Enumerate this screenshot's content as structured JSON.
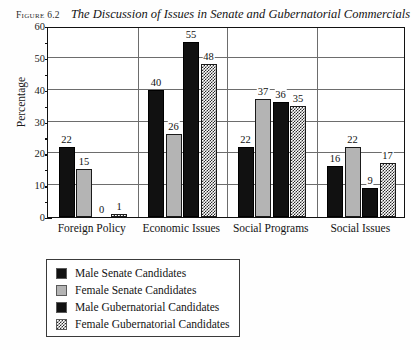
{
  "caption": {
    "figure_label": "Figure 6.2",
    "title": "The Discussion of Issues in Senate and Gubernatorial Commercials"
  },
  "chart_data": {
    "type": "bar",
    "title": "The Discussion of Issues in Senate and Gubernatorial Commercials",
    "xlabel": "",
    "ylabel": "Percentage",
    "ylim": [
      0,
      60
    ],
    "yticks": [
      0,
      10,
      20,
      30,
      40,
      50,
      60
    ],
    "ytick_labels": [
      "0",
      "10",
      "20",
      "30",
      "40",
      "50",
      "60"
    ],
    "minor_tick_step": 5,
    "grid": "horizontal",
    "legend_position": "below-left",
    "categories": [
      "Foreign Policy",
      "Economic Issues",
      "Social Programs",
      "Social Issues"
    ],
    "series": [
      {
        "name": "Male Senate Candidates",
        "values": [
          22,
          40,
          22,
          16
        ]
      },
      {
        "name": "Female Senate Candidates",
        "values": [
          15,
          26,
          37,
          22
        ]
      },
      {
        "name": "Male Gubernatorial Candidates",
        "values": [
          0,
          55,
          36,
          9
        ]
      },
      {
        "name": "Female Gubernatorial Candidates",
        "values": [
          1,
          48,
          35,
          17
        ]
      }
    ],
    "data_labels": [
      [
        "22",
        "15",
        "0",
        "1"
      ],
      [
        "40",
        "26",
        "55",
        "48"
      ],
      [
        "22",
        "37",
        "36",
        "35"
      ],
      [
        "16",
        "22",
        "9",
        "17"
      ]
    ]
  },
  "legend": {
    "items": [
      {
        "label": "Male Senate Candidates",
        "swatch": "solid-black"
      },
      {
        "label": "Female Senate Candidates",
        "swatch": "solid-gray"
      },
      {
        "label": "Male Gubernatorial Candidates",
        "swatch": "solid-black"
      },
      {
        "label": "Female Gubernatorial Candidates",
        "swatch": "checkered"
      }
    ]
  },
  "colors": {
    "series_black": "#111111",
    "series_gray": "#b4b4b4",
    "series_checker": "#2a2a2a",
    "axis": "#111111",
    "grid": "#6d6d6d",
    "background": "#fefefe"
  }
}
